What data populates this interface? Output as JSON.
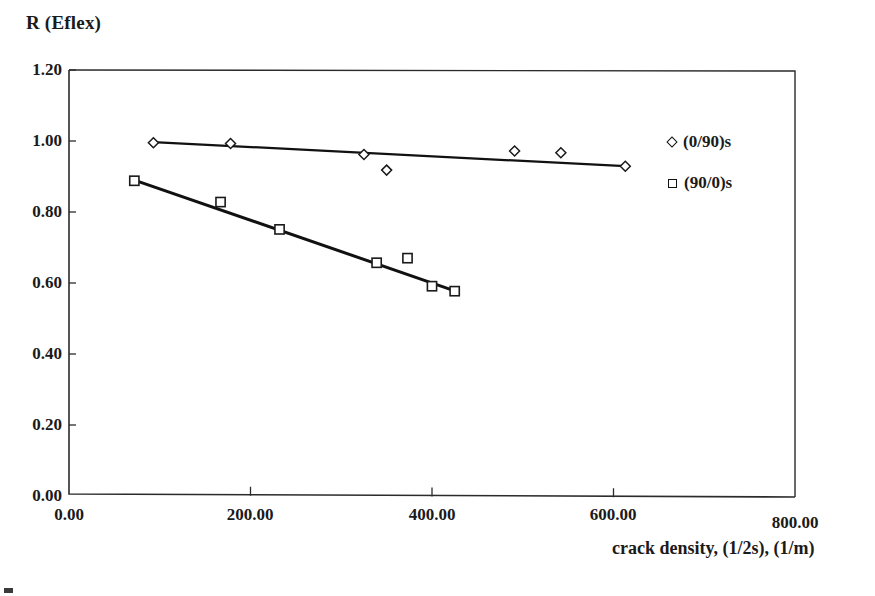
{
  "chart_data": {
    "type": "scatter",
    "title": "",
    "ylabel": "R (Eflex)",
    "xlabel": "crack density, (1/2s), (1/m)",
    "xlim": [
      0,
      800
    ],
    "ylim": [
      0,
      1.2
    ],
    "xticks": [
      "0.00",
      "200.00",
      "400.00",
      "600.00",
      "800.00"
    ],
    "xtick_values": [
      0,
      200,
      400,
      600,
      800
    ],
    "yticks": [
      "0.00",
      "0.20",
      "0.40",
      "0.60",
      "0.80",
      "1.00",
      "1.20"
    ],
    "ytick_values": [
      0,
      0.2,
      0.4,
      0.6,
      0.8,
      1.0,
      1.2
    ],
    "grid": false,
    "legend_position": "top-right-outside",
    "series": [
      {
        "name": "(0/90)s",
        "marker": "diamond",
        "points": [
          {
            "x": 93,
            "y": 0.995
          },
          {
            "x": 178,
            "y": 0.993
          },
          {
            "x": 325,
            "y": 0.962
          },
          {
            "x": 350,
            "y": 0.918
          },
          {
            "x": 491,
            "y": 0.972
          },
          {
            "x": 542,
            "y": 0.967
          },
          {
            "x": 613,
            "y": 0.929
          }
        ],
        "trendline": [
          {
            "x": 93,
            "y": 0.997
          },
          {
            "x": 613,
            "y": 0.929
          }
        ]
      },
      {
        "name": "(90/0)s",
        "marker": "square",
        "points": [
          {
            "x": 72,
            "y": 0.888
          },
          {
            "x": 167,
            "y": 0.828
          },
          {
            "x": 232,
            "y": 0.751
          },
          {
            "x": 339,
            "y": 0.657
          },
          {
            "x": 373,
            "y": 0.67
          },
          {
            "x": 400,
            "y": 0.591
          },
          {
            "x": 425,
            "y": 0.577
          }
        ],
        "trendline": [
          {
            "x": 72,
            "y": 0.89
          },
          {
            "x": 425,
            "y": 0.578
          }
        ]
      }
    ]
  },
  "colors": {
    "axis": "#2b2b2b",
    "series_line": "#111111",
    "marker_stroke": "#1a1a1a",
    "text": "#141414",
    "background": "#ffffff"
  },
  "legend": {
    "items": [
      {
        "label": "(0/90)s",
        "marker": "diamond"
      },
      {
        "label": "(90/0)s",
        "marker": "square"
      }
    ]
  }
}
